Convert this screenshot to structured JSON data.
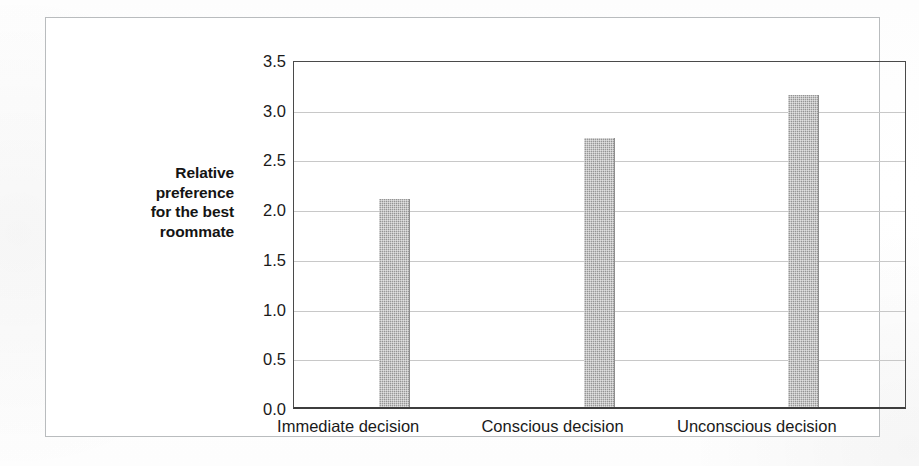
{
  "chart_data": {
    "type": "bar",
    "title": "",
    "xlabel": "",
    "ylabel": "Relative preference for the best roommate",
    "ylabel_lines": [
      "Relative",
      "preference",
      "for the best",
      "roommate"
    ],
    "categories": [
      "Immediate decision",
      "Conscious decision",
      "Unconscious decision"
    ],
    "values": [
      2.09,
      2.71,
      3.14
    ],
    "ylim": [
      0.0,
      3.5
    ],
    "ytick_values": [
      0.0,
      0.5,
      1.0,
      1.5,
      2.0,
      2.5,
      3.0,
      3.5
    ],
    "ytick_labels": [
      "0.0",
      "0.5",
      "1.0",
      "1.5",
      "2.0",
      "2.5",
      "3.0",
      "3.5"
    ],
    "grid": true,
    "grid_axis": "y",
    "legend": false,
    "legend_position": "none",
    "bar_color": "#9a9a9a",
    "bar_fill_pattern": "halftone-checker",
    "axis_color": "#3d3d3d",
    "gridline_color": "#c8c8c8",
    "frame_color": "#b9bcbe",
    "background_color": "#ffffff"
  }
}
